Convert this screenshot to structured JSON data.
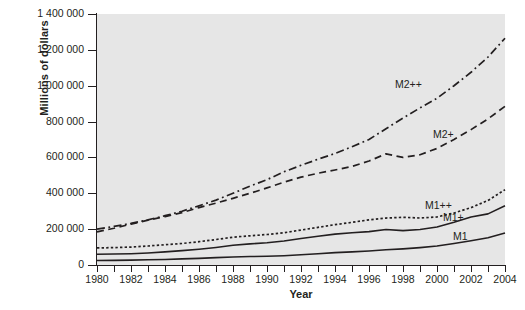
{
  "chart_data": {
    "type": "line",
    "title": "",
    "xlabel": "Year",
    "ylabel": "Millions of dollars",
    "xlim": [
      1980,
      2004
    ],
    "ylim": [
      0,
      1400000
    ],
    "grid": false,
    "legend_position": "inline-labels",
    "plot_background": "#e6e6e6",
    "line_color": "#231f20",
    "y_ticks": [
      0,
      200000,
      400000,
      600000,
      800000,
      1000000,
      1200000,
      1400000
    ],
    "y_tick_labels": [
      "0",
      "200 000",
      "400 000",
      "600 000",
      "800 000",
      "1 000 000",
      "1 200 000",
      "1 400 000"
    ],
    "x_ticks": [
      1980,
      1981,
      1982,
      1983,
      1984,
      1985,
      1986,
      1987,
      1988,
      1989,
      1990,
      1991,
      1992,
      1993,
      1994,
      1995,
      1996,
      1997,
      1998,
      1999,
      2000,
      2001,
      2002,
      2003,
      2004
    ],
    "x_tick_labels": [
      "1980",
      "",
      "1982",
      "",
      "1984",
      "",
      "1986",
      "",
      "1988",
      "",
      "1990",
      "",
      "1992",
      "",
      "1994",
      "",
      "1996",
      "",
      "1998",
      "",
      "2000",
      "",
      "2002",
      "",
      "2004"
    ],
    "x": [
      1980,
      1981,
      1982,
      1983,
      1984,
      1985,
      1986,
      1987,
      1988,
      1989,
      1990,
      1991,
      1992,
      1993,
      1994,
      1995,
      1996,
      1997,
      1998,
      1999,
      2000,
      2001,
      2002,
      2003,
      2004
    ],
    "series": [
      {
        "name": "M2++",
        "style": "dash-dot",
        "label_x": 2000.0,
        "values": [
          200000,
          215000,
          232000,
          252000,
          275000,
          300000,
          330000,
          362000,
          400000,
          440000,
          476000,
          520000,
          556000,
          590000,
          622000,
          660000,
          700000,
          760000,
          820000,
          876000,
          930000,
          1000000,
          1075000,
          1160000,
          1265000
        ]
      },
      {
        "name": "M2+",
        "style": "dashed",
        "label_x": 2000.0,
        "values": [
          185000,
          205000,
          228000,
          250000,
          270000,
          292000,
          320000,
          345000,
          372000,
          400000,
          430000,
          462000,
          490000,
          512000,
          530000,
          550000,
          580000,
          620000,
          600000,
          615000,
          650000,
          700000,
          755000,
          815000,
          885000
        ]
      },
      {
        "name": "M1++",
        "style": "dotted",
        "label_x": 2000.0,
        "values": [
          95000,
          97000,
          100000,
          106000,
          113000,
          120000,
          130000,
          142000,
          155000,
          163000,
          170000,
          180000,
          195000,
          210000,
          225000,
          238000,
          252000,
          262000,
          266000,
          262000,
          268000,
          290000,
          320000,
          360000,
          420000
        ]
      },
      {
        "name": "M1+",
        "style": "solid",
        "label_x": 2000.0,
        "values": [
          60000,
          61000,
          63000,
          67000,
          73000,
          80000,
          88000,
          98000,
          110000,
          118000,
          124000,
          134000,
          148000,
          160000,
          172000,
          180000,
          186000,
          198000,
          192000,
          198000,
          212000,
          238000,
          268000,
          285000,
          330000
        ]
      },
      {
        "name": "M1",
        "style": "solid",
        "label_x": 2000.0,
        "values": [
          25000,
          26000,
          27000,
          29000,
          31000,
          34000,
          37000,
          41000,
          45000,
          47000,
          49000,
          52000,
          57000,
          63000,
          69000,
          73000,
          78000,
          85000,
          90000,
          97000,
          106000,
          120000,
          135000,
          152000,
          178000
        ]
      }
    ]
  }
}
